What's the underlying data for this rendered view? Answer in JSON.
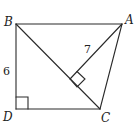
{
  "diagram": {
    "stroke_color": "#2a2a2a",
    "points": {
      "A": {
        "label": "A",
        "x": 122,
        "y": 24
      },
      "B": {
        "label": "B",
        "x": 16,
        "y": 24
      },
      "C": {
        "label": "C",
        "x": 100,
        "y": 109
      },
      "D": {
        "label": "D",
        "x": 16,
        "y": 109
      },
      "E": {
        "label": "",
        "x": 70,
        "y": 79
      }
    },
    "segments": [
      {
        "from": "B",
        "to": "A"
      },
      {
        "from": "B",
        "to": "D"
      },
      {
        "from": "D",
        "to": "C"
      },
      {
        "from": "C",
        "to": "A"
      },
      {
        "from": "B",
        "to": "C"
      },
      {
        "from": "A",
        "to": "E"
      }
    ],
    "measurements": [
      {
        "segment": "BD",
        "label": "6"
      },
      {
        "segment": "AE",
        "label": "7"
      }
    ],
    "right_angles": [
      "D",
      "E"
    ]
  }
}
